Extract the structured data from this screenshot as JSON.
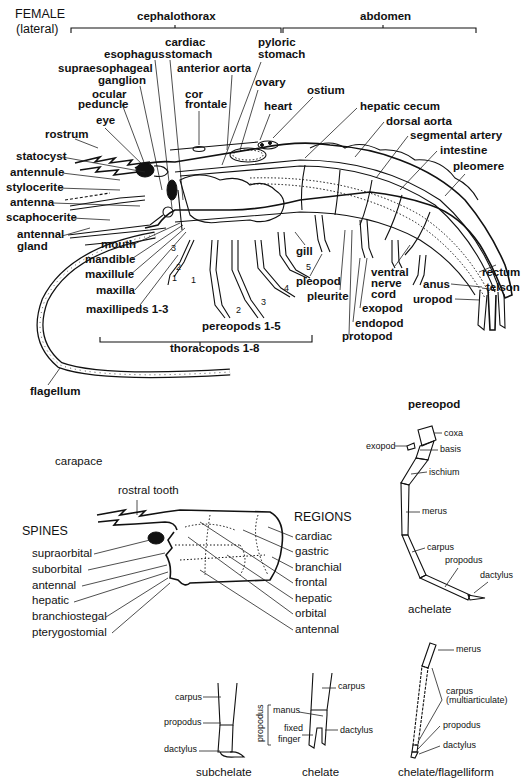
{
  "title": {
    "sex": "FEMALE",
    "view": "(lateral)"
  },
  "regions": {
    "cephalothorax": "cephalothorax",
    "abdomen": "abdomen"
  },
  "main_labels": {
    "cardiac_stomach_1": "cardiac",
    "cardiac_stomach_2": "stomach",
    "pyloric_stomach_1": "pyloric",
    "pyloric_stomach_2": "stomach",
    "esophagus": "esophagus",
    "supraesophageal_1": "supraesophageal",
    "supraesophageal_2": "ganglion",
    "anterior_aorta": "anterior aorta",
    "ovary": "ovary",
    "ocular_peduncle_1": "ocular",
    "ocular_peduncle_2": "peduncle",
    "cor_frontale_1": "cor",
    "cor_frontale_2": "frontale",
    "heart": "heart",
    "ostium": "ostium",
    "eye": "eye",
    "hepatic_cecum": "hepatic  cecum",
    "dorsal_aorta": "dorsal aorta",
    "rostrum": "rostrum",
    "segmental_artery": "segmental artery",
    "statocyst": "statocyst",
    "intestine": "intestine",
    "antennule": "antennule",
    "pleomere": "pleomere",
    "stylocerite": "stylocerite",
    "antenna": "antenna",
    "scaphocerite": "scaphocerite",
    "antennal_gland_1": "antennal",
    "antennal_gland_2": "gland",
    "gill": "gill",
    "mouth": "mouth",
    "mandible": "mandible",
    "maxillule": "maxillule",
    "maxilla": "maxilla",
    "maxillipeds": "maxillipeds 1-3",
    "pleopod": "pleopod",
    "pleurite": "pleurite",
    "ventral_nerve_1": "ventral",
    "ventral_nerve_2": "nerve",
    "ventral_nerve_3": "cord",
    "exopod": "exopod",
    "endopod": "endopod",
    "protopod": "protopod",
    "rectum": "rectum",
    "anus": "anus",
    "telson": "telson",
    "uropod": "uropod",
    "pereopods": "pereopods 1-5",
    "thoracopods": "thoracopods 1-8",
    "flagellum": "flagellum",
    "leg_numbers": [
      "1",
      "2",
      "3",
      "4",
      "5"
    ],
    "maxilliped_numbers": [
      "1",
      "2",
      "3"
    ]
  },
  "carapace": {
    "title": "carapace",
    "rostral_tooth": "rostral tooth",
    "spines_heading": "SPINES",
    "spines": [
      "supraorbital",
      "suborbital",
      "antennal",
      "hepatic",
      "branchiostegal",
      "pterygostomial"
    ],
    "regions_heading": "REGIONS",
    "regions": [
      "cardiac",
      "gastric",
      "branchial",
      "frontal",
      "hepatic",
      "orbital",
      "antennal"
    ]
  },
  "pereopod": {
    "title": "pereopod",
    "parts": [
      "coxa",
      "exopod",
      "basis",
      "ischium",
      "merus",
      "carpus",
      "propodus",
      "dactylus"
    ],
    "caption": "achelate"
  },
  "subchelate": {
    "parts": [
      "carpus",
      "propodus",
      "dactylus"
    ],
    "caption": "subchelate"
  },
  "chelate": {
    "parts": [
      "carpus",
      "manus",
      "fixed",
      "finger",
      "dactylus"
    ],
    "bracket": "propodus",
    "caption": "chelate"
  },
  "flagelliform": {
    "parts": [
      "merus",
      "carpus",
      "(multiarticulate)",
      "propodus",
      "dactylus"
    ],
    "caption": "chelate/flagelliform"
  }
}
